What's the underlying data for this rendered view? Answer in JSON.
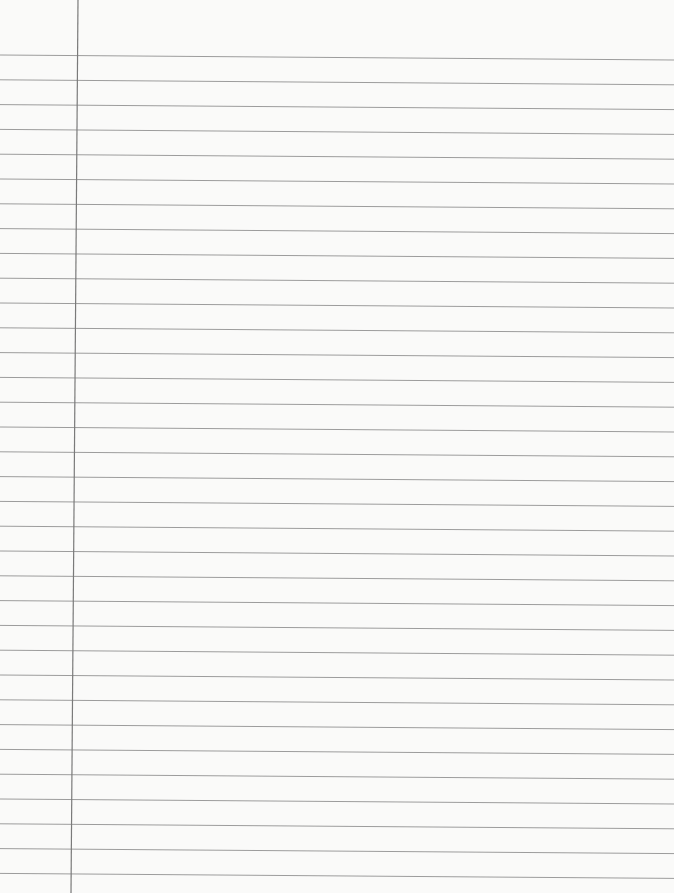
{
  "page": {
    "type": "blank lined notebook paper",
    "ruled_line_count": 34,
    "has_margin_line": true,
    "handwritten_text": ""
  },
  "colors": {
    "paper": "#fafaf9",
    "ruled_line": "#8c8c8c",
    "margin_line": "#7a7a7a"
  }
}
